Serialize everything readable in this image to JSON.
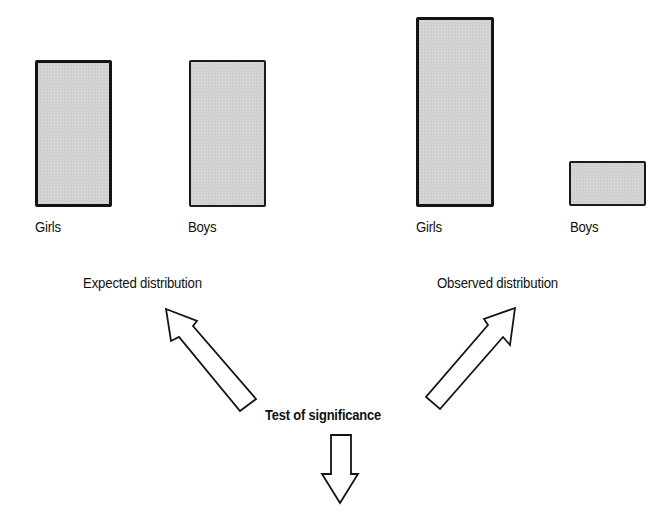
{
  "diagram": {
    "panels": [
      {
        "title": "Expected distribution",
        "bars": [
          {
            "label": "Girls",
            "relative_height": 146
          },
          {
            "label": "Boys",
            "relative_height": 146
          }
        ]
      },
      {
        "title": "Observed distribution",
        "bars": [
          {
            "label": "Girls",
            "relative_height": 189
          },
          {
            "label": "Boys",
            "relative_height": 45
          }
        ]
      }
    ],
    "center_label": "Test of significance",
    "arrows": [
      {
        "from": "Test of significance",
        "to": "Expected distribution",
        "direction": "up-left"
      },
      {
        "from": "Test of significance",
        "to": "Observed distribution",
        "direction": "up-right"
      },
      {
        "from": "Test of significance",
        "to": "",
        "direction": "down"
      }
    ],
    "colors": {
      "bar_fill": "#d0d0d0",
      "stroke": "#141414",
      "background": "#ffffff"
    }
  }
}
